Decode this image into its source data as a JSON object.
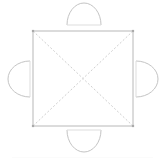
{
  "figure": {
    "name": "square-pyramid-net",
    "background_color": "#ffffff"
  },
  "style": {
    "outline_color": "#b8b8b8",
    "fold_line_color": "#cfcfcf",
    "semicircle_color": "#c4c4c4",
    "vertex_marker_color": "#aaaaaa",
    "stroke_width": 1,
    "fold_dash_pattern": "2 2",
    "fill": "none"
  },
  "square": {
    "label": "square-base",
    "left": 33,
    "top": 31,
    "right": 133,
    "bottom": 126,
    "width": 100,
    "height": 95,
    "vertices": [
      {
        "name": "top-left",
        "x": 33,
        "y": 31
      },
      {
        "name": "top-right",
        "x": 133,
        "y": 31
      },
      {
        "name": "bottom-right",
        "x": 133,
        "y": 126
      },
      {
        "name": "bottom-left",
        "x": 33,
        "y": 126
      }
    ]
  },
  "diagonals": [
    {
      "name": "diagonal-tl-br",
      "x1": 33,
      "y1": 31,
      "x2": 133,
      "y2": 126
    },
    {
      "name": "diagonal-tr-bl",
      "x1": 133,
      "y1": 31,
      "x2": 33,
      "y2": 126
    }
  ],
  "center_point": {
    "name": "diagonal-intersection",
    "x": 83,
    "y": 78.5
  },
  "semicircles": [
    {
      "name": "semicircle-top",
      "side": "top",
      "bulge_direction": "up",
      "center_x": 84,
      "center_y": 25,
      "radius_x": 17,
      "radius_y": 22,
      "path": "M 67 25 A 17 22 0 0 1 101 25"
    },
    {
      "name": "semicircle-bottom",
      "side": "bottom",
      "bulge_direction": "down",
      "center_x": 84,
      "center_y": 130,
      "radius_x": 17,
      "radius_y": 22,
      "path": "M 67 130 A 17 22 0 0 0 101 130"
    },
    {
      "name": "semicircle-left",
      "side": "left",
      "bulge_direction": "left",
      "center_x": 30,
      "center_y": 79,
      "radius_x": 22,
      "radius_y": 18,
      "path": "M 30 61 A 22 18 0 0 0 30 97"
    },
    {
      "name": "semicircle-right",
      "side": "right",
      "bulge_direction": "right",
      "center_x": 136,
      "center_y": 79,
      "radius_x": 22,
      "radius_y": 18,
      "path": "M 136 61 A 22 18 0 0 1 136 97"
    }
  ],
  "footer": {
    "name": "faint-baseline-artifact",
    "visible": true
  }
}
